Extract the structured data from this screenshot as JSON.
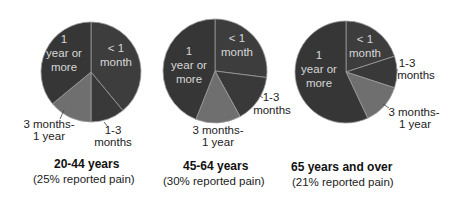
{
  "chart_data": [
    {
      "type": "pie",
      "title": "20-44 years",
      "subtitle": "(25% reported pain)",
      "categories": [
        "< 1 month",
        "1-3 months",
        "3 months-1 year",
        "1 year or more"
      ],
      "values": [
        39,
        11,
        14,
        36
      ],
      "unit": "percent (estimated from slice angles)",
      "start_angle": "12 o'clock, clockwise"
    },
    {
      "type": "pie",
      "title": "45-64 years",
      "subtitle": "(30% reported pain)",
      "categories": [
        "< 1 month",
        "1-3 months",
        "3 months-1 year",
        "1 year or more"
      ],
      "values": [
        27,
        15,
        14,
        44
      ],
      "unit": "percent (estimated from slice angles)",
      "start_angle": "12 o'clock, clockwise"
    },
    {
      "type": "pie",
      "title": "65 years and over",
      "subtitle": "(21% reported pain)",
      "categories": [
        "< 1 month",
        "1-3 months",
        "3 months-1 year",
        "1 year or more"
      ],
      "values": [
        20,
        10,
        13,
        57
      ],
      "unit": "percent (estimated from slice angles)",
      "start_angle": "12 o'clock, clockwise"
    }
  ],
  "colors": {
    "< 1 month": "#3d3d3d",
    "1-3 months": "#393939",
    "3 months-1 year": "#6f6f6f",
    "1 year or more": "#363636",
    "separator": "#9a9a9a"
  },
  "pies": [
    {
      "cx": 91,
      "cy": 72,
      "r": 50,
      "title": "20-44 years",
      "subtitle": "(25% reported pain)",
      "labels": {
        "lt1": [
          "< 1",
          "month"
        ],
        "m13": [
          "1-3",
          "months"
        ],
        "m3y1": [
          "3 months-",
          "1 year"
        ],
        "y1": [
          "1",
          "year or",
          "more"
        ]
      }
    },
    {
      "cx": 215,
      "cy": 71,
      "r": 52,
      "title": "45-64 years",
      "subtitle": "(30% reported pain)",
      "labels": {
        "lt1": [
          "< 1",
          "month"
        ],
        "m13": [
          "1-3",
          "months"
        ],
        "m3y1": [
          "3 months-",
          "1 year"
        ],
        "y1": [
          "1",
          "year or",
          "more"
        ]
      }
    },
    {
      "cx": 346,
      "cy": 72,
      "r": 51,
      "title": "65 years and over",
      "subtitle": "(21% reported pain)",
      "labels": {
        "lt1": [
          "< 1",
          "month"
        ],
        "m13": [
          "1-3",
          "months"
        ],
        "m3y1": [
          "3 months-",
          "1 year"
        ],
        "y1": [
          "1",
          "year or",
          "more"
        ]
      }
    }
  ]
}
